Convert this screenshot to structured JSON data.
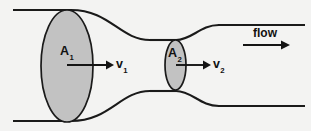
{
  "figure": {
    "name": "pipe-flow-continuity-diagram",
    "background_color": "#f3f3f2",
    "stroke_color": "#1a1a1a",
    "disc_fill_color": "#c2c2c2"
  },
  "labels": {
    "area_1": "A",
    "area_1_sub": "1",
    "area_2": "A",
    "area_2_sub": "2",
    "velocity_1": "v",
    "velocity_1_sub": "1",
    "velocity_2": "v",
    "velocity_2_sub": "2",
    "flow": "flow"
  },
  "geometry": {
    "width": 311,
    "height": 131,
    "wall_top_left": {
      "x1": 13,
      "y1": 10,
      "x2": 70,
      "y2": 10
    },
    "wall_bottom_left": {
      "x1": 13,
      "y1": 121,
      "x2": 70,
      "y2": 121
    },
    "wall_top_right": {
      "x1": 218,
      "y1": 25,
      "x2": 305,
      "y2": 25
    },
    "wall_bottom_right": {
      "x1": 218,
      "y1": 106,
      "x2": 305,
      "y2": 106
    },
    "disc_large": {
      "cx": 67,
      "cy": 66,
      "rx": 26,
      "ry": 56
    },
    "disc_small": {
      "cx": 175.5,
      "cy": 65,
      "rx": 10.5,
      "ry": 25
    },
    "arrow_v1": {
      "x1": 67,
      "y1": 65,
      "x2": 113,
      "y2": 65
    },
    "arrow_v2": {
      "x1": 176,
      "y1": 65,
      "x2": 210,
      "y2": 65
    },
    "arrow_flow": {
      "x1": 243,
      "y1": 45,
      "x2": 289,
      "y2": 45
    }
  }
}
